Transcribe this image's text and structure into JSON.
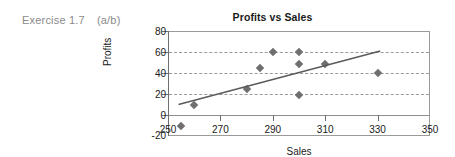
{
  "exercise": {
    "label": "Exercise 1.7",
    "parts": "(a/b)"
  },
  "chart_data": {
    "type": "scatter",
    "title": "Profits vs Sales",
    "xlabel": "Sales",
    "ylabel": "Profits",
    "xlim": [
      250,
      350
    ],
    "ylim": [
      -20,
      80
    ],
    "xticks": [
      250,
      270,
      290,
      310,
      330,
      350
    ],
    "yticks": [
      -20,
      0,
      20,
      40,
      60,
      80
    ],
    "grid": "horizontal-dashed",
    "legend": "none",
    "marker": "diamond",
    "marker_color": "#6f6f6f",
    "points": [
      {
        "x": 255,
        "y": -10
      },
      {
        "x": 260,
        "y": 10
      },
      {
        "x": 280,
        "y": 25
      },
      {
        "x": 285,
        "y": 45
      },
      {
        "x": 290,
        "y": 60
      },
      {
        "x": 300,
        "y": 60
      },
      {
        "x": 300,
        "y": 49
      },
      {
        "x": 300,
        "y": 19
      },
      {
        "x": 310,
        "y": 49
      },
      {
        "x": 330,
        "y": 40
      }
    ],
    "trendline": {
      "x0": 254,
      "y0": 10,
      "x1": 331,
      "y1": 61,
      "color": "#5a5a5a"
    }
  }
}
